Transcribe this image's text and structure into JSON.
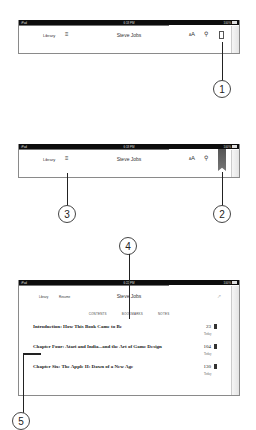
{
  "screens": [
    {
      "status": {
        "left": "iPad",
        "time": "6:18 PM",
        "battery": "100%"
      },
      "toolbar": {
        "library": "Library",
        "toc_icon": "list-icon",
        "title": "Steve Jobs",
        "font_icon": "AA",
        "search_icon": "search-icon",
        "bookmark_icon": "bookmark-outline-icon"
      },
      "callouts": [
        "1"
      ]
    },
    {
      "status": {
        "left": "iPad",
        "time": "6:18 PM",
        "battery": "100%"
      },
      "toolbar": {
        "library": "Library",
        "toc_icon": "list-icon",
        "title": "Steve Jobs",
        "font_icon": "AA",
        "search_icon": "search-icon",
        "bookmark_icon": "bookmark-filled-icon"
      },
      "callouts": [
        "3",
        "2"
      ]
    },
    {
      "status": {
        "left": "iPad",
        "time": "6:22 PM",
        "battery": "100%"
      },
      "toolbar": {
        "library": "Library",
        "resume": "Resume",
        "title": "Steve Jobs"
      },
      "tabs": [
        "CONTENTS",
        "BOOKMARKS",
        "NOTES"
      ],
      "bookmarks": [
        {
          "title": "Introduction: How This Book Came to Be",
          "page": "23",
          "date": "Today"
        },
        {
          "title": "Chapter Four: Atari and India...and the Art of Game Design",
          "page": "104",
          "date": "Today"
        },
        {
          "title": "Chapter Six: The Apple II: Dawn of a New Age",
          "page": "130",
          "date": "Today"
        }
      ],
      "callouts": [
        "4",
        "5"
      ]
    }
  ]
}
